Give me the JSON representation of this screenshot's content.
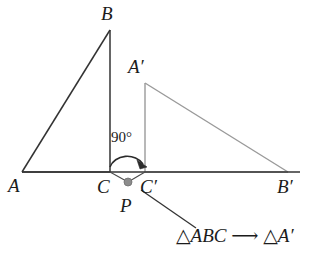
{
  "figure": {
    "type": "geometry-diagram",
    "width": 311,
    "height": 260,
    "background_color": "#ffffff"
  },
  "colors": {
    "preimage_stroke": "#333333",
    "image_stroke": "#9a9a9a",
    "baseline_stroke": "#333333",
    "point_marker": "#8c8c8c",
    "arc_stroke": "#2b2b2b",
    "leader_stroke": "#333333",
    "text": "#1b1b1b"
  },
  "preimage_triangle": {
    "name": "triangle-ABC",
    "vertices": [
      {
        "id": "A",
        "label": "A",
        "x": 22,
        "y": 172,
        "label_x": 8,
        "label_y": 176
      },
      {
        "id": "B",
        "label": "B",
        "x": 110,
        "y": 30,
        "label_x": 101,
        "label_y": 4
      },
      {
        "id": "C",
        "label": "C",
        "x": 110,
        "y": 172,
        "label_x": 97,
        "label_y": 177
      }
    ]
  },
  "image_triangle": {
    "name": "triangle-A-prime-B-prime-C-prime",
    "vertices": [
      {
        "id": "Aprime",
        "label": "A′",
        "x": 145,
        "y": 83,
        "label_x": 128,
        "label_y": 57
      },
      {
        "id": "Bprime",
        "label": "B′",
        "x": 288,
        "y": 172,
        "label_x": 277,
        "label_y": 177
      },
      {
        "id": "Cprime",
        "label": "C′",
        "x": 145,
        "y": 172,
        "label_x": 140,
        "label_y": 177
      }
    ]
  },
  "center_of_rotation": {
    "id": "P",
    "label": "P",
    "x": 128,
    "y": 182,
    "label_x": 120,
    "label_y": 196,
    "marker_radius": 4
  },
  "rotation": {
    "angle_value": "90",
    "angle_unit": "°",
    "angle_label": "90°",
    "angle_label_x": 111,
    "angle_label_y": 130,
    "direction": "clockwise",
    "arc_start_x": 110,
    "arc_end_x": 145,
    "arc_y": 166
  },
  "baseline": {
    "name": "baseline",
    "x1": 22,
    "y1": 172,
    "x2": 300,
    "y2": 172
  },
  "caption": {
    "preimage_symbol": "△ABC",
    "arrow_symbol": "⟶",
    "image_symbol": "△A′",
    "full_text": "△ABC ⟶ △A′",
    "x": 176,
    "y": 226,
    "clipped_right_edge": true
  },
  "leader_line": {
    "name": "caption-leader-line",
    "x1": 141,
    "y1": 190,
    "x2": 196,
    "y2": 228
  }
}
